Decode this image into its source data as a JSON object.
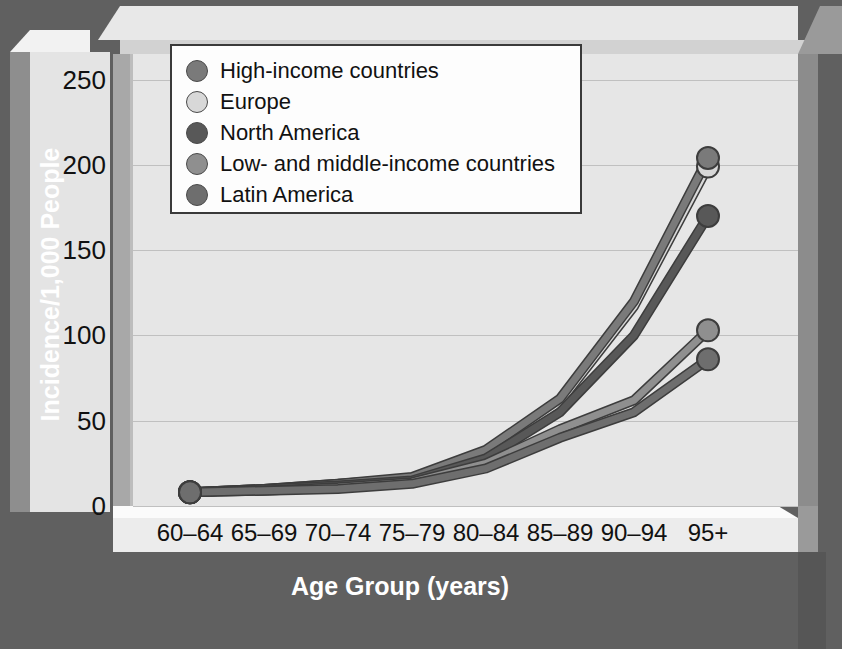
{
  "chart_data": {
    "type": "line",
    "title": "",
    "xlabel": "Age Group (years)",
    "ylabel": "Incidence/1,000 People",
    "categories": [
      "60–64",
      "65–69",
      "70–74",
      "75–79",
      "80–84",
      "85–89",
      "90–94",
      "95+"
    ],
    "yticks": [
      0,
      50,
      100,
      150,
      200,
      250
    ],
    "ylim": [
      0,
      265
    ],
    "grid": true,
    "legend_position": "top-left-inside",
    "series": [
      {
        "name": "High-income countries",
        "color": "#7a7a7a",
        "values": [
          8,
          10,
          13,
          17,
          33,
          63,
          120,
          204
        ]
      },
      {
        "name": "Europe",
        "color": "#d8d8d8",
        "values": [
          8,
          10,
          13,
          16,
          31,
          61,
          117,
          199
        ]
      },
      {
        "name": "North America",
        "color": "#585858",
        "values": [
          8,
          10,
          12,
          15,
          28,
          55,
          100,
          170
        ]
      },
      {
        "name": "Low- and middle-income countries",
        "color": "#8f8f8f",
        "values": [
          8,
          9,
          11,
          14,
          25,
          45,
          62,
          103
        ]
      },
      {
        "name": "Latin America",
        "color": "#6e6e6e",
        "values": [
          8,
          9,
          10,
          13,
          22,
          40,
          55,
          86
        ]
      }
    ]
  }
}
